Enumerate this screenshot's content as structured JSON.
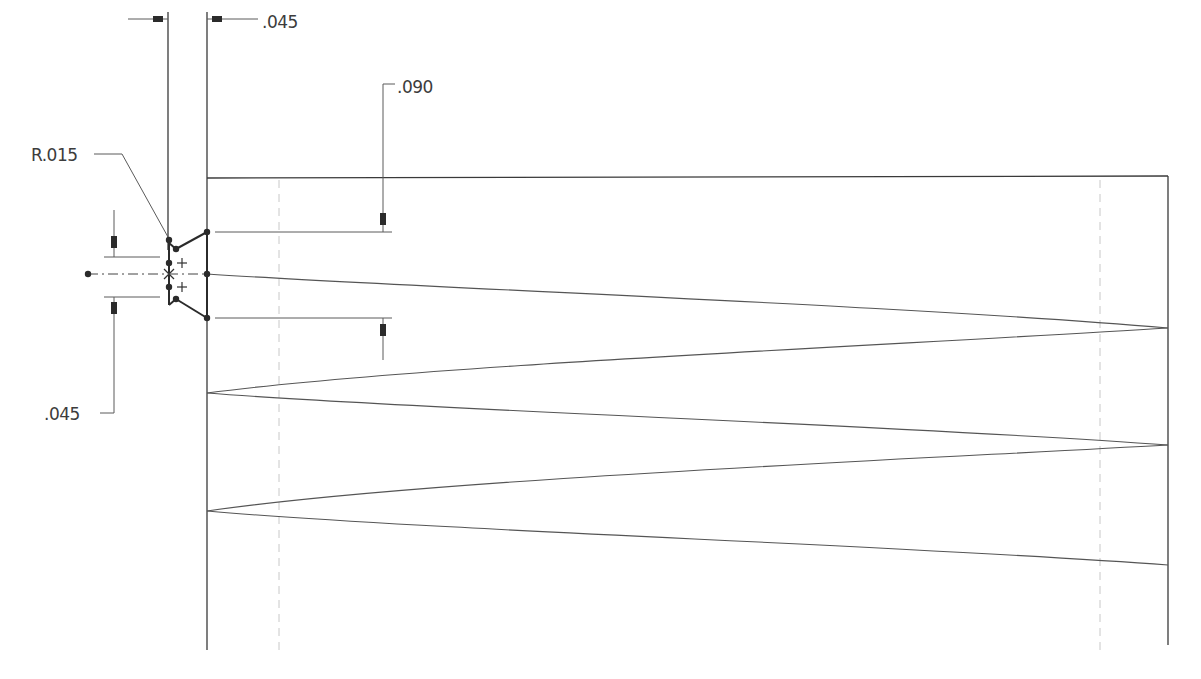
{
  "drawing": {
    "type": "CAD sketch",
    "description": "Thread profile sketch with swept helix",
    "colors": {
      "line": "#3a3a3a",
      "hidden_line": "#c8c8c8",
      "background": "#ffffff"
    }
  },
  "dimensions": [
    {
      "id": "top-width",
      "label": ".045",
      "x": 262,
      "y": 28
    },
    {
      "id": "depth",
      "label": ".090",
      "x": 397,
      "y": 95
    },
    {
      "id": "radius",
      "label": "R.015",
      "x": 32,
      "y": 161
    },
    {
      "id": "root-width",
      "label": ".045",
      "x": 44,
      "y": 419
    }
  ],
  "geometry": {
    "body_left_x": 207,
    "body_right_x": 1168,
    "body_top_y": 178,
    "body_bottom_y": 650,
    "hidden_line_left_x": 279,
    "hidden_line_right_x": 1100,
    "centerline_y": 274
  }
}
